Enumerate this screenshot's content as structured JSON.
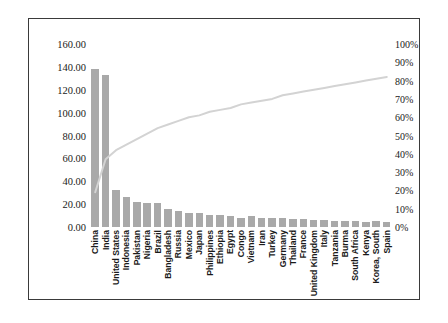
{
  "chart_data": {
    "type": "bar",
    "title": "",
    "subtitle": "",
    "xlabel": "",
    "ylabel": "",
    "y2label": "",
    "grid": false,
    "legend_position": "none",
    "categories": [
      "China",
      "India",
      "United States",
      "Indonesia",
      "Pakistan",
      "Nigeria",
      "Brazil",
      "Bangladesh",
      "Russia",
      "Mexico",
      "Japan",
      "Philippines",
      "Ethiopia",
      "Egypt",
      "Congo",
      "Vietnam",
      "Iran",
      "Turkey",
      "Germany",
      "Thailand",
      "France",
      "United Kingdom",
      "Italy",
      "Tanzania",
      "Burma",
      "South Africa",
      "Kenya",
      "Korea, South",
      "Spain"
    ],
    "series": [
      {
        "name": "Population",
        "type": "bar",
        "axis": "left",
        "color": "#a9a9a9",
        "values": [
          138.0,
          132.6,
          32.4,
          26.0,
          22.0,
          21.0,
          20.7,
          15.7,
          14.2,
          12.4,
          12.6,
          10.5,
          10.2,
          9.5,
          8.3,
          9.6,
          8.2,
          8.0,
          8.1,
          6.8,
          6.7,
          6.5,
          6.2,
          5.5,
          5.5,
          5.5,
          4.7,
          5.1,
          4.8
        ]
      },
      {
        "name": "Cumulative %",
        "type": "line",
        "axis": "right",
        "color": "#d3d3d3",
        "values": [
          19,
          37,
          42,
          45,
          48,
          51,
          54,
          56,
          58,
          60,
          61,
          63,
          64,
          65,
          67,
          68,
          69,
          70,
          72,
          73,
          74,
          75,
          76,
          77,
          78,
          79,
          80,
          81,
          82
        ]
      }
    ],
    "left_axis": {
      "min": 0,
      "max": 160,
      "step": 20,
      "ticks": [
        "160.00",
        "140.00",
        "120.00",
        "100.00",
        "80.00",
        "60.00",
        "40.00",
        "20.00",
        "0.00"
      ]
    },
    "right_axis": {
      "min": 0,
      "max": 100,
      "step": 10,
      "ticks": [
        "100%",
        "90%",
        "80%",
        "70%",
        "60%",
        "50%",
        "40%",
        "30%",
        "20%",
        "10%",
        "0%"
      ]
    }
  }
}
